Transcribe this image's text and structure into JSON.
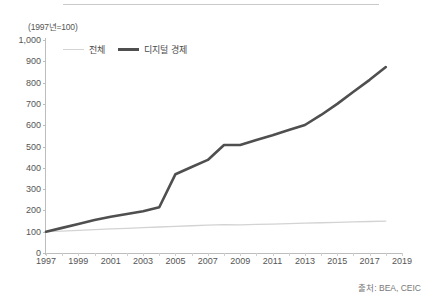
{
  "chart_data": {
    "type": "line",
    "title": "",
    "subtitle": "",
    "unit_note": "(1997년=100)",
    "xlabel": "",
    "ylabel": "",
    "xlim": [
      1997,
      2019
    ],
    "ylim": [
      0,
      1000
    ],
    "grid": false,
    "legend_position": "top-left",
    "x": [
      1997,
      1998,
      1999,
      2000,
      2001,
      2002,
      2003,
      2004,
      2005,
      2006,
      2007,
      2008,
      2009,
      2010,
      2011,
      2012,
      2013,
      2014,
      2015,
      2016,
      2017,
      2018
    ],
    "xticks": [
      "1997",
      "1999",
      "2001",
      "2003",
      "2005",
      "2007",
      "2009",
      "2011",
      "2013",
      "2015",
      "2017",
      "2019"
    ],
    "ytick_labels": [
      "0",
      "100",
      "200",
      "300",
      "400",
      "500",
      "600",
      "700",
      "800",
      "900",
      "1,000"
    ],
    "ytick_values": [
      0,
      100,
      200,
      300,
      400,
      500,
      600,
      700,
      800,
      900,
      1000
    ],
    "series": [
      {
        "name": "전체",
        "color": "#d3d3d3",
        "width": 1.3,
        "values": [
          100,
          103,
          106,
          110,
          113,
          116,
          119,
          122,
          125,
          128,
          131,
          133,
          132,
          134,
          136,
          138,
          140,
          142,
          144,
          146,
          148,
          150
        ]
      },
      {
        "name": "디지털 경제",
        "color": "#4f4f4f",
        "width": 2.6,
        "values": [
          100,
          118,
          136,
          155,
          170,
          183,
          196,
          215,
          370,
          404,
          437,
          507,
          507,
          531,
          553,
          577,
          601,
          648,
          700,
          757,
          813,
          873
        ]
      }
    ],
    "source": "출처: BEA, CEIC"
  },
  "legend": {
    "items": [
      {
        "label": "전체",
        "swatch": "total"
      },
      {
        "label": "디지털 경제",
        "swatch": "digital"
      }
    ]
  },
  "footer": {
    "source_text": "출처: BEA, CEIC"
  },
  "axis": {
    "unit_note": "(1997년=100)"
  },
  "colors": {
    "total_line": "#d3d3d3",
    "digital_line": "#4f4f4f",
    "axis": "#bdbdbd",
    "text": "#4a4a4a",
    "rule": "#c9c9c9"
  }
}
